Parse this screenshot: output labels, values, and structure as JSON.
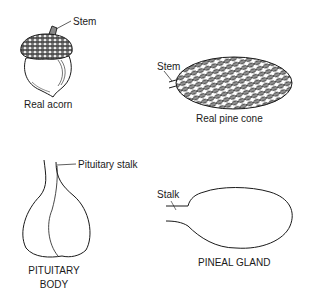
{
  "figure": {
    "acorn": {
      "callout": "Stem",
      "caption": "Real acorn"
    },
    "pine_cone": {
      "callout": "Stem",
      "caption": "Real pine cone"
    },
    "pituitary": {
      "callout": "Pituitary stalk",
      "caption_line1": "PITUITARY",
      "caption_line2": "BODY"
    },
    "pineal": {
      "callout": "Stalk",
      "caption": "PINEAL GLAND"
    },
    "colors": {
      "ink": "#1a1a1a",
      "background": "#ffffff"
    }
  }
}
